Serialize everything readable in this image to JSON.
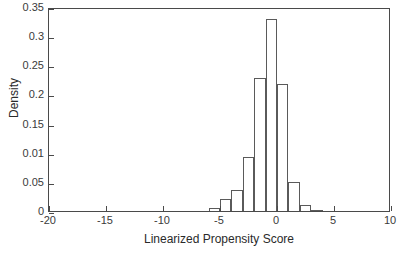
{
  "chart_data": {
    "type": "bar",
    "title": "",
    "subtitle": "",
    "xlabel": "Linearized Propensity Score",
    "ylabel": "Density",
    "xlim": [
      -20,
      10
    ],
    "ylim": [
      0,
      0.35
    ],
    "grid": false,
    "legend": null,
    "bin_width": 1,
    "bin_edges": [
      -6,
      -5,
      -4,
      -3,
      -2,
      -1,
      0,
      1,
      2,
      3,
      4
    ],
    "categories": [
      "-6 to -5",
      "-5 to -4",
      "-4 to -3",
      "-3 to -2",
      "-2 to -1",
      "-1 to 0",
      "0 to 1",
      "1 to 2",
      "2 to 3",
      "3 to 4"
    ],
    "values": [
      0.005,
      0.02,
      0.036,
      0.093,
      0.228,
      0.329,
      0.218,
      0.05,
      0.01,
      0.002
    ],
    "xticks": [
      -20,
      -15,
      -10,
      -5,
      0,
      5,
      10
    ],
    "xticklabels": [
      "-20",
      "-15",
      "-10",
      "-5",
      "0",
      "5",
      "10"
    ],
    "yticks": [
      0,
      0.05,
      0.1,
      0.15,
      0.2,
      0.25,
      0.3,
      0.35
    ],
    "yticklabels": [
      "0",
      "0.05",
      "0.01",
      "0.15",
      "0.2",
      "0.25",
      "0.3",
      "0.35"
    ],
    "axis_color": "#4a4a4a",
    "bar_edge_color": "#5a5a5a",
    "bar_fill_color": "#ffffff",
    "background_color": "#ffffff"
  }
}
